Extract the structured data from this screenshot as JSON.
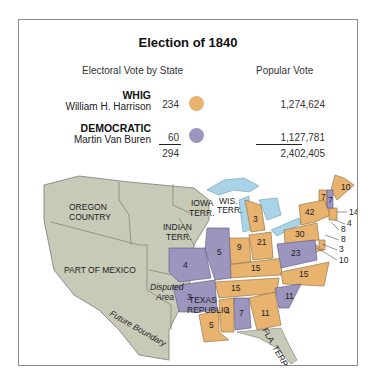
{
  "title": "Election of 1840",
  "headers": {
    "electoral": "Electoral Vote by State",
    "popular": "Popular Vote"
  },
  "parties": [
    {
      "party": "WHIG",
      "candidate": "William H. Harrison",
      "electoral": "234",
      "popular": "1,274,624",
      "color": "#e8b26f"
    },
    {
      "party": "DEMOCRATIC",
      "candidate": "Martin Van Buren",
      "electoral": "60",
      "popular": "1,127,781",
      "color": "#9c95bd"
    }
  ],
  "totals": {
    "electoral": "294",
    "popular": "2,402,405"
  },
  "map": {
    "territory_color": "#c8cab8",
    "water_color": "#a9d3e6",
    "territories": [
      "OREGON COUNTRY",
      "IOWA TERR.",
      "WIS. TERR.",
      "INDIAN TERR.",
      "PART OF MEXICO",
      "Disputed Area",
      "TEXAS REPUBLIC",
      "FLA. TERR."
    ],
    "annotation": "Future Boundary",
    "state_votes": [
      {
        "label": "10",
        "party": "WHIG"
      },
      {
        "label": "7",
        "party": "WHIG"
      },
      {
        "label": "7",
        "party": "DEMOCRATIC"
      },
      {
        "label": "14",
        "party": "WHIG"
      },
      {
        "label": "42",
        "party": "WHIG"
      },
      {
        "label": "4",
        "party": "WHIG"
      },
      {
        "label": "8",
        "party": "WHIG"
      },
      {
        "label": "30",
        "party": "WHIG"
      },
      {
        "label": "8",
        "party": "WHIG"
      },
      {
        "label": "3",
        "party": "WHIG"
      },
      {
        "label": "10",
        "party": "WHIG"
      },
      {
        "label": "3",
        "party": "WHIG"
      },
      {
        "label": "21",
        "party": "WHIG"
      },
      {
        "label": "9",
        "party": "WHIG"
      },
      {
        "label": "5",
        "party": "DEMOCRATIC"
      },
      {
        "label": "4",
        "party": "DEMOCRATIC"
      },
      {
        "label": "23",
        "party": "DEMOCRATIC"
      },
      {
        "label": "15",
        "party": "WHIG"
      },
      {
        "label": "15",
        "party": "WHIG"
      },
      {
        "label": "15",
        "party": "WHIG"
      },
      {
        "label": "3",
        "party": "DEMOCRATIC"
      },
      {
        "label": "11",
        "party": "DEMOCRATIC"
      },
      {
        "label": "4",
        "party": "WHIG"
      },
      {
        "label": "7",
        "party": "DEMOCRATIC"
      },
      {
        "label": "11",
        "party": "WHIG"
      },
      {
        "label": "5",
        "party": "WHIG"
      }
    ]
  }
}
